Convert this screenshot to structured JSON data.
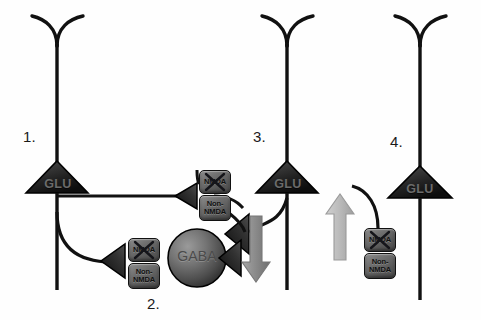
{
  "figure": {
    "type": "neural-circuit-diagram",
    "background_color": "#fefefe",
    "ink_color": "#111111"
  },
  "labels": {
    "n1": "1.",
    "n2": "2.",
    "n3": "3.",
    "n4": "4."
  },
  "neurons": [
    {
      "id": "neuron-1",
      "label": "1.",
      "soma_text": "GLU",
      "type": "pyramidal-glutamatergic",
      "x": 57,
      "y": 172
    },
    {
      "id": "neuron-3",
      "label": "3.",
      "soma_text": "GLU",
      "type": "pyramidal-glutamatergic",
      "x": 287,
      "y": 172
    },
    {
      "id": "neuron-4",
      "label": "4.",
      "soma_text": "GLU",
      "type": "pyramidal-glutamatergic",
      "x": 420,
      "y": 177
    }
  ],
  "interneuron": {
    "id": "neuron-2",
    "label": "2.",
    "soma_text": "GABA",
    "type": "gabaergic-interneuron",
    "cx": 197,
    "cy": 258,
    "r": 29
  },
  "soma_labels": {
    "glu": "GLU",
    "gaba": "GABA"
  },
  "receptors": {
    "nmda_label": "NMDA",
    "non_nmda_label": "Non-\nNMDA",
    "blocked_marker": "X",
    "groups": [
      {
        "id": "receptor-group-1",
        "target": "neuron-2-dendrite-upper",
        "nmda_blocked": true,
        "x": 199,
        "y": 170
      },
      {
        "id": "receptor-group-2",
        "target": "neuron-2-soma",
        "nmda_blocked": true,
        "x": 128,
        "y": 238
      },
      {
        "id": "receptor-group-3",
        "target": "neuron-4-dendrite",
        "nmda_blocked": true,
        "x": 364,
        "y": 228
      }
    ]
  },
  "arrows": [
    {
      "id": "arrow-decrease",
      "direction": "down",
      "meaning": "decreased-activity",
      "color": "#8c8c8c",
      "x": 256,
      "y": 216
    },
    {
      "id": "arrow-increase",
      "direction": "up",
      "meaning": "increased-activity",
      "color": "#b8b8b8",
      "x": 340,
      "y": 206
    }
  ],
  "colors": {
    "soma_dark": "#2b2b2b",
    "soma_mid": "#555555",
    "receptor_fill": "#6f6f6f",
    "arrow_down": "#8c8c8c",
    "arrow_up": "#b8b8b8",
    "outline": "#111111"
  }
}
